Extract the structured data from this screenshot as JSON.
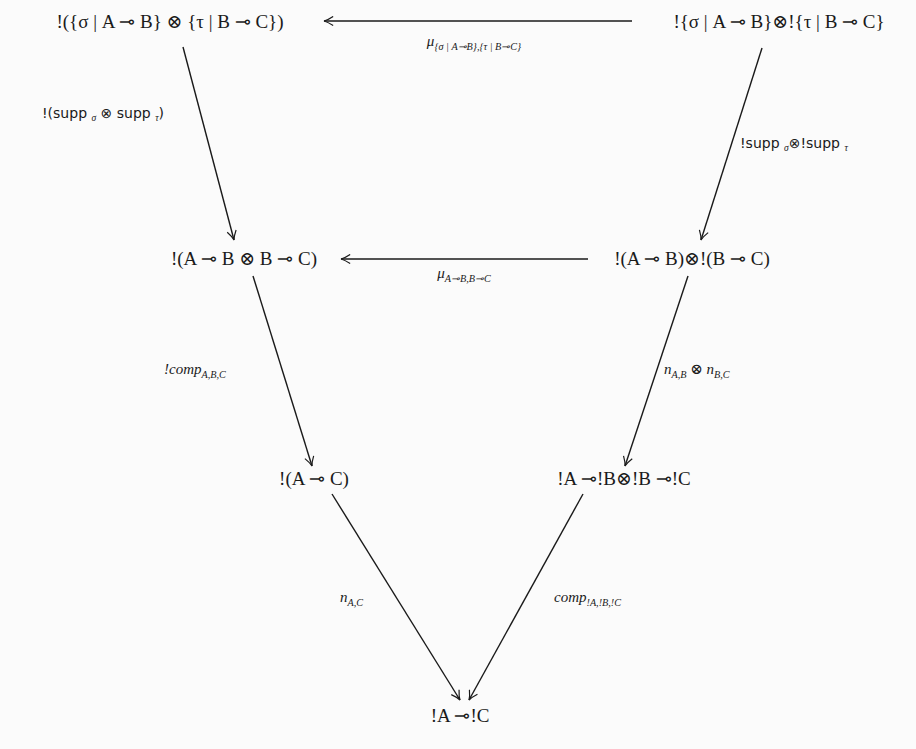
{
  "diagram": {
    "title": "",
    "nodes": {
      "top_left": {
        "text": "!({σ | A ⊸ B} ⊗ {τ | B ⊸ C})",
        "x": 170,
        "y": 21
      },
      "top_right": {
        "text": "!{σ | A ⊸ B}⊗!{τ | B ⊸ C}",
        "x": 779,
        "y": 21
      },
      "mid_left": {
        "text": "!(A ⊸ B ⊗ B ⊸ C)",
        "x": 244,
        "y": 258
      },
      "mid_right": {
        "text": "!(A ⊸ B)⊗!(B ⊸ C)",
        "x": 692,
        "y": 258
      },
      "low_left": {
        "text": "!(A ⊸ C)",
        "x": 314,
        "y": 478
      },
      "low_right": {
        "text": "!A ⊸!B⊗!B ⊸!C",
        "x": 624,
        "y": 478
      },
      "bottom": {
        "text": "!A ⊸!C",
        "x": 460,
        "y": 715
      }
    },
    "labels": {
      "mu_top": {
        "main": "μ",
        "sub": "{σ | A⊸B},{τ | B⊸C}"
      },
      "supp_left": {
        "text": "!(supp σ ⊗ supp τ)",
        "parts": [
          "!(supp ",
          "σ",
          " ⊗ supp ",
          "τ",
          ")"
        ]
      },
      "supp_right": {
        "text": "!supp σ ⊗!supp τ",
        "parts": [
          "!supp ",
          "σ",
          "⊗!supp ",
          "τ"
        ]
      },
      "mu_mid": {
        "main": "μ",
        "sub": "A⊸B,B⊸C"
      },
      "comp_left": {
        "main": "!comp",
        "sub": "A,B,C"
      },
      "n_tensor": {
        "main1": "n",
        "sub1": "A,B",
        "op": " ⊗ ",
        "main2": "n",
        "sub2": "B,C"
      },
      "n_ac": {
        "main": "n",
        "sub": "A,C"
      },
      "comp_bang": {
        "main": "comp",
        "sub": "!A,!B,!C"
      }
    },
    "arrows": [
      {
        "from": "top_right",
        "to": "top_left",
        "label": "mu_top"
      },
      {
        "from": "top_left",
        "to": "mid_left",
        "label": "supp_left"
      },
      {
        "from": "top_right",
        "to": "mid_right",
        "label": "supp_right"
      },
      {
        "from": "mid_right",
        "to": "mid_left",
        "label": "mu_mid"
      },
      {
        "from": "mid_left",
        "to": "low_left",
        "label": "comp_left"
      },
      {
        "from": "mid_right",
        "to": "low_right",
        "label": "n_tensor"
      },
      {
        "from": "low_left",
        "to": "bottom",
        "label": "n_ac"
      },
      {
        "from": "low_right",
        "to": "bottom",
        "label": "comp_bang"
      }
    ],
    "colors": {
      "ink": "#1a1a1a",
      "background": "#fbfbfb"
    }
  }
}
